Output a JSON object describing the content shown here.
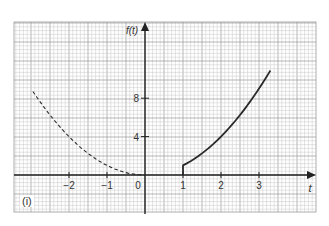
{
  "panel_label": "(i)",
  "colors": {
    "grid_minor": "#c8c8c8",
    "grid_major": "#9a9a9a",
    "axis": "#222222",
    "curve": "#2a2a2a",
    "background": "#ffffff"
  },
  "chart_data": {
    "type": "line",
    "title": "",
    "xlabel": "t",
    "ylabel": "f(t)",
    "xlim": [
      -3.4,
      4.5
    ],
    "ylim": [
      -3.8,
      16.0
    ],
    "grid": true,
    "x_ticks": [
      -2,
      -1,
      0,
      1,
      2,
      3
    ],
    "x_tick_labels": [
      "−2",
      "−1",
      "0",
      "1",
      "2",
      "3"
    ],
    "y_ticks": [
      4,
      8
    ],
    "y_tick_labels": [
      "4",
      "8"
    ],
    "legend": null,
    "annotations": [
      "(i)"
    ],
    "series": [
      {
        "name": "f(t) = t^2, t < 0 (dashed, shifted-out portion)",
        "style": "dashed",
        "x": [
          -3.0,
          -2.5,
          -2.0,
          -1.5,
          -1.0,
          -0.5,
          0.0
        ],
        "y": [
          9.0,
          6.25,
          4.0,
          2.25,
          1.0,
          0.25,
          0.0
        ]
      },
      {
        "name": "f(t) = t^2 u(t-1) (solid)",
        "style": "solid",
        "x": [
          1.0,
          1.0,
          1.5,
          2.0,
          2.5,
          3.0,
          3.3
        ],
        "y": [
          0.0,
          1.0,
          2.25,
          4.0,
          6.25,
          9.0,
          10.9
        ]
      }
    ]
  }
}
